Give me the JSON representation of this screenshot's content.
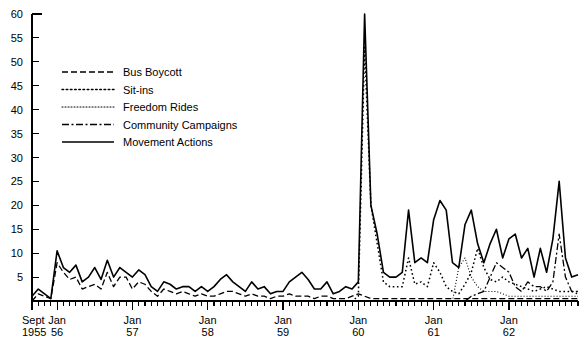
{
  "chart_data": {
    "type": "line",
    "title": "",
    "xlabel": "",
    "ylabel": "",
    "ylim": [
      0,
      60
    ],
    "yticks": [
      0,
      5,
      10,
      15,
      20,
      25,
      30,
      35,
      40,
      45,
      50,
      55,
      60
    ],
    "ytick_labels": [
      "",
      "5",
      "10",
      "15",
      "20",
      "25",
      "30",
      "35",
      "40",
      "45",
      "50",
      "55",
      "60"
    ],
    "grid": false,
    "legend_position": "upper-left",
    "x_start": "Sept 1955",
    "x_end": "Dec 1962",
    "x_tick_interval": "monthly",
    "x_major_labels": [
      {
        "line1": "Sept",
        "line2": "1955",
        "index": 0
      },
      {
        "line1": "Jan",
        "line2": "56",
        "index": 4
      },
      {
        "line1": "Jan",
        "line2": "57",
        "index": 16
      },
      {
        "line1": "Jan",
        "line2": "58",
        "index": 28
      },
      {
        "line1": "Jan",
        "line2": "59",
        "index": 40
      },
      {
        "line1": "Jan",
        "line2": "60",
        "index": 52
      },
      {
        "line1": "Jan",
        "line2": "61",
        "index": 64
      },
      {
        "line1": "Jan",
        "line2": "62",
        "index": 76
      }
    ],
    "x": [
      "1955-09",
      "1955-10",
      "1955-11",
      "1955-12",
      "1956-01",
      "1956-02",
      "1956-03",
      "1956-04",
      "1956-05",
      "1956-06",
      "1956-07",
      "1956-08",
      "1956-09",
      "1956-10",
      "1956-11",
      "1956-12",
      "1957-01",
      "1957-02",
      "1957-03",
      "1957-04",
      "1957-05",
      "1957-06",
      "1957-07",
      "1957-08",
      "1957-09",
      "1957-10",
      "1957-11",
      "1957-12",
      "1958-01",
      "1958-02",
      "1958-03",
      "1958-04",
      "1958-05",
      "1958-06",
      "1958-07",
      "1958-08",
      "1958-09",
      "1958-10",
      "1958-11",
      "1958-12",
      "1959-01",
      "1959-02",
      "1959-03",
      "1959-04",
      "1959-05",
      "1959-06",
      "1959-07",
      "1959-08",
      "1959-09",
      "1959-10",
      "1959-11",
      "1959-12",
      "1960-01",
      "1960-02",
      "1960-03",
      "1960-04",
      "1960-05",
      "1960-06",
      "1960-07",
      "1960-08",
      "1960-09",
      "1960-10",
      "1960-11",
      "1960-12",
      "1961-01",
      "1961-02",
      "1961-03",
      "1961-04",
      "1961-05",
      "1961-06",
      "1961-07",
      "1961-08",
      "1961-09",
      "1961-10",
      "1961-11",
      "1961-12",
      "1962-01",
      "1962-02",
      "1962-03",
      "1962-04",
      "1962-05",
      "1962-06",
      "1962-07",
      "1962-08",
      "1962-09",
      "1962-10",
      "1962-11",
      "1962-12"
    ],
    "series": [
      {
        "name": "Bus Boycott",
        "style": "dashed",
        "dash": "6,3",
        "width": 1.3,
        "values": [
          0,
          1.5,
          1,
          0.5,
          8,
          6,
          4.5,
          5,
          2.5,
          3,
          3.5,
          2.5,
          6,
          3,
          5,
          5,
          2.5,
          4,
          3.5,
          2,
          1,
          2.5,
          2,
          1.5,
          2,
          1.5,
          1,
          1.5,
          1,
          1,
          1.5,
          2,
          2,
          1.5,
          1,
          1.5,
          1,
          1,
          0.5,
          1,
          1,
          1.5,
          1,
          1,
          1,
          0.5,
          1,
          1,
          0.5,
          0.5,
          0.5,
          1,
          1.5,
          1,
          0.5,
          0.5,
          0.5,
          0.5,
          0.5,
          0.5,
          0.5,
          0.5,
          0.5,
          0.5,
          0.5,
          0.5,
          0.5,
          0.5,
          0.5,
          0.5,
          0.5,
          0.5,
          0.5,
          0.5,
          0.5,
          0.5,
          0.5,
          0.5,
          0.5,
          0.5,
          0.5,
          0.5,
          0.5,
          0.5,
          0.5,
          0.5,
          0.5,
          0.5
        ]
      },
      {
        "name": "Sit-ins",
        "style": "dotted",
        "dash": "1.6,2.6",
        "width": 1.5,
        "values": [
          0,
          0,
          0,
          0,
          0,
          0,
          0,
          0,
          0,
          0,
          0,
          0,
          0,
          0,
          0,
          0,
          0,
          0,
          0,
          0,
          0,
          0,
          0,
          0,
          0,
          0,
          0,
          0,
          0,
          0,
          0,
          0,
          0,
          0,
          0,
          0,
          0,
          0,
          0,
          0,
          0,
          0,
          0,
          0,
          0,
          0,
          0,
          0,
          0,
          0,
          0,
          0,
          1,
          53,
          20,
          12,
          4,
          3,
          3,
          3,
          9,
          3.5,
          4,
          3,
          8,
          6,
          3,
          2,
          1.5,
          3.5,
          6,
          11,
          7,
          4.5,
          4,
          5,
          4,
          3.5,
          3,
          2.5,
          2,
          2.5,
          3,
          2.5,
          2,
          2,
          2,
          1.5
        ]
      },
      {
        "name": "Freedom Rides",
        "style": "fine-dotted",
        "dash": "1,2",
        "width": 1.1,
        "values": [
          0,
          0,
          0,
          0,
          0,
          0,
          0,
          0,
          0,
          0,
          0,
          0,
          0,
          0,
          0,
          0,
          0,
          0,
          0,
          0,
          0,
          0,
          0,
          0,
          0,
          0,
          0,
          0,
          0,
          0,
          0,
          0,
          0,
          0,
          0,
          0,
          0,
          0,
          0,
          0,
          0,
          0,
          0,
          0,
          0,
          0,
          0,
          0,
          0,
          0,
          0,
          0,
          0,
          0,
          0,
          0,
          0,
          0,
          0,
          0,
          0,
          0,
          0,
          0,
          0,
          0,
          0,
          0,
          7,
          9,
          5,
          3,
          2,
          2,
          2,
          1.5,
          1,
          1,
          1,
          1,
          1,
          1,
          1,
          1,
          1,
          1,
          1,
          1
        ]
      },
      {
        "name": "Community Campaigns",
        "style": "dash-dot",
        "dash": "7,2.5,2,2.5",
        "width": 1.3,
        "values": [
          0,
          0,
          0,
          0,
          0,
          0,
          0,
          0,
          0,
          0,
          0,
          0,
          0,
          0,
          0,
          0,
          0,
          0,
          0,
          0,
          0,
          0,
          0,
          0,
          0,
          0,
          0,
          0,
          0,
          0,
          0,
          0,
          0,
          0,
          0,
          0,
          0,
          0,
          0,
          0,
          0,
          0,
          0,
          0,
          0,
          0,
          0,
          0,
          0,
          0,
          0,
          0,
          0,
          0,
          0,
          0,
          0,
          0,
          0,
          0,
          0,
          0,
          0,
          0,
          0,
          0,
          0,
          0,
          0,
          0,
          1,
          1.5,
          2,
          5,
          8,
          7,
          6,
          3,
          2,
          4,
          3,
          3,
          2,
          4,
          14,
          5,
          2,
          2
        ]
      },
      {
        "name": "Movement Actions",
        "style": "solid",
        "dash": "0",
        "width": 1.6,
        "values": [
          1,
          2.5,
          1.5,
          0.5,
          10.5,
          7,
          6,
          7.5,
          4,
          5,
          7,
          4.5,
          8.5,
          5,
          7,
          6,
          5,
          6.5,
          5.5,
          3,
          2,
          4,
          3.5,
          2.5,
          3,
          3,
          2,
          3,
          2,
          3,
          4.5,
          5.5,
          4,
          3,
          2,
          4,
          2.5,
          3,
          1.5,
          2,
          2,
          4,
          5,
          6,
          4.5,
          2.5,
          2.5,
          4,
          1.5,
          2,
          3,
          2.5,
          4,
          60,
          20,
          14,
          6,
          5,
          5,
          6,
          19,
          8,
          9,
          8,
          17,
          21,
          19,
          8,
          7,
          16,
          19,
          12,
          8,
          12,
          15,
          9,
          13,
          14,
          9,
          11,
          5,
          11,
          6,
          13,
          25,
          9,
          5,
          5.5
        ]
      }
    ]
  },
  "legend": {
    "items": [
      {
        "label": "Bus Boycott"
      },
      {
        "label": "Sit-ins"
      },
      {
        "label": "Freedom Rides"
      },
      {
        "label": "Community Campaigns"
      },
      {
        "label": "Movement Actions"
      }
    ]
  }
}
